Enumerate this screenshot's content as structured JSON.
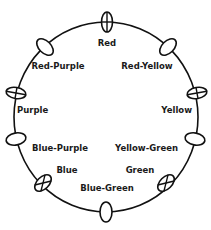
{
  "diagram": {
    "type": "color-wheel",
    "ring": {
      "cx": 106,
      "cy": 117,
      "rx": 92,
      "ry": 95
    },
    "nodes": [
      {
        "name": "Red",
        "cx": 107,
        "cy": 22,
        "rx": 5.5,
        "ry": 10,
        "rot": 0,
        "mark": "plus",
        "label_x": 107,
        "label_y": 46,
        "anchor": "middle"
      },
      {
        "name": "Red-Yellow",
        "cx": 168,
        "cy": 47,
        "rx": 10,
        "ry": 6,
        "rot": -45,
        "mark": "none",
        "label_x": 147,
        "label_y": 69,
        "anchor": "middle"
      },
      {
        "name": "Yellow",
        "cx": 197,
        "cy": 93,
        "rx": 10,
        "ry": 5.5,
        "rot": -10,
        "mark": "plus",
        "label_x": 192,
        "label_y": 113,
        "anchor": "end"
      },
      {
        "name": "Yellow-Green",
        "cx": 195,
        "cy": 139,
        "rx": 10,
        "ry": 6,
        "rot": 10,
        "mark": "none",
        "label_x": 178,
        "label_y": 151,
        "anchor": "end"
      },
      {
        "name": "Green",
        "cx": 166,
        "cy": 183,
        "rx": 10,
        "ry": 6,
        "rot": -45,
        "mark": "x",
        "label_x": 140,
        "label_y": 173,
        "anchor": "middle"
      },
      {
        "name": "Blue-Green",
        "cx": 106,
        "cy": 212,
        "rx": 6,
        "ry": 10,
        "rot": 0,
        "mark": "none",
        "label_x": 107,
        "label_y": 191,
        "anchor": "middle"
      },
      {
        "name": "Blue",
        "cx": 43,
        "cy": 183,
        "rx": 10,
        "ry": 6,
        "rot": -45,
        "mark": "x",
        "label_x": 67,
        "label_y": 173,
        "anchor": "middle"
      },
      {
        "name": "Blue-Purple",
        "cx": 16,
        "cy": 139,
        "rx": 10,
        "ry": 6,
        "rot": -10,
        "mark": "none",
        "label_x": 32,
        "label_y": 151,
        "anchor": "start"
      },
      {
        "name": "Purple",
        "cx": 16,
        "cy": 93,
        "rx": 10,
        "ry": 5.5,
        "rot": 10,
        "mark": "plus",
        "label_x": 17,
        "label_y": 113,
        "anchor": "start"
      },
      {
        "name": "Red-Purple",
        "cx": 45,
        "cy": 47,
        "rx": 10,
        "ry": 6,
        "rot": 45,
        "mark": "none",
        "label_x": 58,
        "label_y": 69,
        "anchor": "middle"
      }
    ]
  }
}
